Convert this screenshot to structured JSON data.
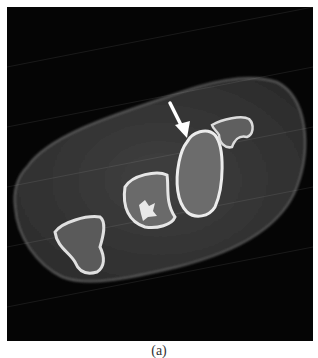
{
  "figure": {
    "type": "axial CT scan of wrist (carpal bones)",
    "caption": "(a)",
    "annotation": {
      "type": "arrow",
      "color": "#ffffff",
      "direction": "down-right",
      "points_to": "bone cortex margin"
    },
    "colors": {
      "background": "#050505",
      "soft_tissue": "#3a3a3a",
      "bone_cortex": "#e6e6e6",
      "bone_marrow": "#6e6e6e"
    }
  }
}
